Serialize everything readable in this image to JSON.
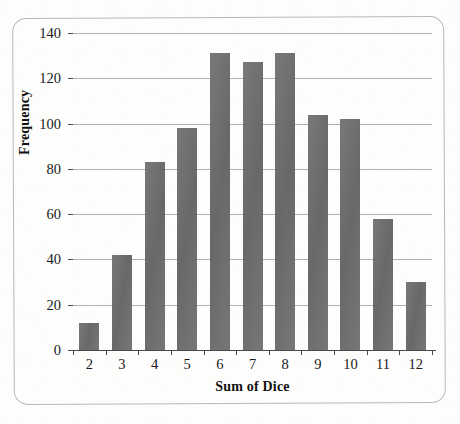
{
  "chart_data": {
    "type": "bar",
    "title": "",
    "xlabel": "Sum of Dice",
    "ylabel": "Frequency",
    "categories": [
      "2",
      "3",
      "4",
      "5",
      "6",
      "7",
      "8",
      "9",
      "10",
      "11",
      "12"
    ],
    "values": [
      12,
      42,
      83,
      98,
      131,
      127,
      131,
      104,
      102,
      58,
      30
    ],
    "ylim": [
      0,
      140
    ],
    "yticks": [
      "0",
      "20",
      "40",
      "60",
      "80",
      "100",
      "120",
      "140"
    ],
    "ytick_values": [
      0,
      20,
      40,
      60,
      80,
      100,
      120,
      140
    ],
    "grid": true,
    "legend": "none",
    "series": [
      {
        "name": "Frequency",
        "values": [
          12,
          42,
          83,
          98,
          131,
          127,
          131,
          104,
          102,
          58,
          30
        ]
      }
    ],
    "colors": {
      "bar": "#6e6e6e",
      "gridline": "#b0b0b0",
      "axis": "#4a4a4a",
      "text": "#1a1a1a",
      "frame": "#b9b9b9",
      "background": "#fdfdfc"
    }
  }
}
